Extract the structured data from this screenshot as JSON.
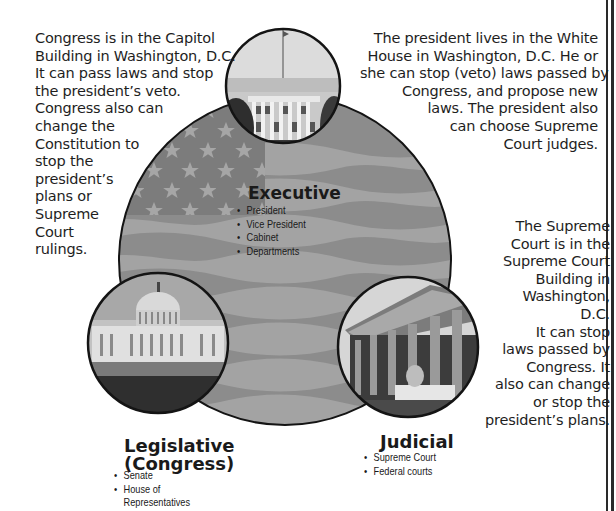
{
  "diagram": {
    "colors": {
      "flag_dark": "#7a7a7a",
      "flag_light": "#9a9a9a",
      "outline": "#141414",
      "background": "#ffffff"
    }
  },
  "descriptions": {
    "legislative": {
      "lines": [
        "Congress is in the Capitol",
        "Building in Washington, D.C.",
        "It can pass laws and stop",
        "the president’s veto.",
        "Congress also can",
        "change the",
        "Constitution to",
        "stop the",
        "president’s",
        "plans or",
        "Supreme",
        "Court",
        "rulings."
      ]
    },
    "executive": {
      "lines": [
        "The president lives in the White",
        "House in Washington, D.C.  He or",
        "she can stop (veto) laws passed by",
        "Congress, and propose new",
        "laws.  The president also",
        "can choose Supreme",
        "Court judges."
      ]
    },
    "judicial": {
      "lines": [
        "The Supreme",
        "Court is in the",
        "Supreme Court",
        "Building in",
        "Washington,",
        "D.C.",
        "It can stop",
        "laws passed by",
        "Congress.  It",
        "also can change",
        "or stop the",
        "president’s plans."
      ]
    }
  },
  "branches": {
    "executive": {
      "title": "Executive",
      "photo": "white-house-photo",
      "items": [
        "President",
        "Vice President",
        "Cabinet",
        "Departments"
      ]
    },
    "legislative": {
      "title_line1": "Legislative",
      "title_line2": "(Congress)",
      "photo": "capitol-building-photo",
      "items": [
        "Senate",
        "House of",
        "Representatives"
      ]
    },
    "judicial": {
      "title": "Judicial",
      "photo": "supreme-court-photo",
      "items": [
        "Supreme Court",
        "Federal courts"
      ]
    }
  },
  "bullet": "•"
}
